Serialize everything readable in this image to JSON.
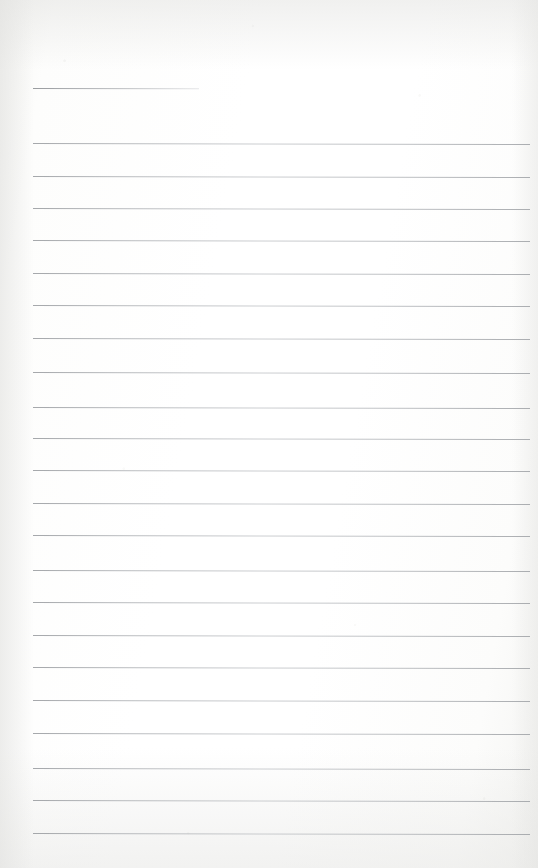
{
  "document": {
    "kind": "ruled-notepad-page",
    "title": "",
    "body_text": "",
    "page_width": 538,
    "page_height": 868,
    "background_color": "#fefefe",
    "rule_color": "#b0b4b8",
    "rule_left_x": 33,
    "rule_right_x": 530,
    "rule_thickness_px": 1,
    "rule_spacing_px": 32,
    "rule_slant_deg": 0.12
  },
  "header_rule": {
    "name": "title-underline",
    "x": 33,
    "y": 88,
    "width": 166
  },
  "rules": [
    {
      "y": 143,
      "x": 33,
      "width": 497
    },
    {
      "y": 176,
      "x": 33,
      "width": 497
    },
    {
      "y": 208,
      "x": 33,
      "width": 497
    },
    {
      "y": 240,
      "x": 33,
      "width": 497
    },
    {
      "y": 273,
      "x": 33,
      "width": 497
    },
    {
      "y": 305,
      "x": 33,
      "width": 497
    },
    {
      "y": 338,
      "x": 33,
      "width": 497
    },
    {
      "y": 372,
      "x": 33,
      "width": 497
    },
    {
      "y": 407,
      "x": 33,
      "width": 497
    },
    {
      "y": 438,
      "x": 33,
      "width": 497
    },
    {
      "y": 470,
      "x": 33,
      "width": 497
    },
    {
      "y": 503,
      "x": 33,
      "width": 497
    },
    {
      "y": 535,
      "x": 33,
      "width": 497
    },
    {
      "y": 570,
      "x": 33,
      "width": 497
    },
    {
      "y": 602,
      "x": 33,
      "width": 497
    },
    {
      "y": 635,
      "x": 33,
      "width": 497
    },
    {
      "y": 667,
      "x": 33,
      "width": 497
    },
    {
      "y": 700,
      "x": 33,
      "width": 497
    },
    {
      "y": 733,
      "x": 33,
      "width": 497
    },
    {
      "y": 768,
      "x": 33,
      "width": 497
    },
    {
      "y": 800,
      "x": 33,
      "width": 497
    },
    {
      "y": 833,
      "x": 33,
      "width": 497
    }
  ]
}
